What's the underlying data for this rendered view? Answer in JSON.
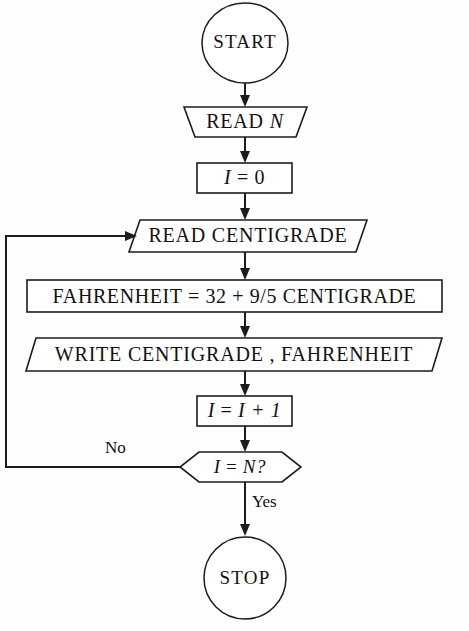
{
  "diagram": {
    "background_color": "#fefefe",
    "line_color": "#1c1c1c",
    "text_color": "#111111"
  },
  "nodes": {
    "start": {
      "label": "START",
      "shape": "oval"
    },
    "read_n": {
      "label": "READ N",
      "label_plain": "READ",
      "label_italic": "N",
      "shape": "trapezoid-input"
    },
    "init_i": {
      "label_lhs": "I",
      "label_op": "=",
      "label_rhs": "0",
      "shape": "rectangle"
    },
    "read_centigrade": {
      "label": "READ CENTIGRADE",
      "shape": "parallelogram-input"
    },
    "compute_fahrenheit": {
      "label": "FAHRENHEIT = 32 + 9/5 CENTIGRADE",
      "shape": "rectangle"
    },
    "write_values": {
      "label": "WRITE  CENTIGRADE ,  FAHRENHEIT",
      "shape": "parallelogram-output"
    },
    "increment_i": {
      "label_lhs": "I",
      "label_op": "=",
      "label_rhs": "I + 1",
      "shape": "rectangle"
    },
    "decision": {
      "label_lhs": "I",
      "label_op": "=",
      "label_rhs": "N?",
      "shape": "hexagon"
    },
    "stop": {
      "label": "STOP",
      "shape": "oval"
    }
  },
  "edge_labels": {
    "no": "No",
    "yes": "Yes"
  }
}
